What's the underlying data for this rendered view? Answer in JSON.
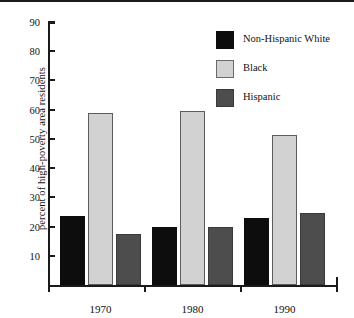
{
  "chart_data": {
    "type": "bar",
    "title": "",
    "xlabel": "",
    "ylabel": "percent of high-poverty area residents",
    "categories": [
      "1970",
      "1980",
      "1990"
    ],
    "series": [
      {
        "name": "Non-Hispanic White",
        "color": "#0d0d0d",
        "values": [
          23.5,
          20.0,
          23.0
        ]
      },
      {
        "name": "Black",
        "color": "#d2d2d2",
        "values": [
          59.0,
          59.5,
          51.5
        ]
      },
      {
        "name": "Hispanic",
        "color": "#4d4d4d",
        "values": [
          17.5,
          20.0,
          24.5
        ]
      }
    ],
    "ylim": [
      0,
      90
    ],
    "ytick_labels": [
      "10",
      "20",
      "30",
      "40",
      "50",
      "60",
      "70",
      "80",
      "90"
    ],
    "ytick_values": [
      10,
      20,
      30,
      40,
      50,
      60,
      70,
      80,
      90
    ],
    "grid": false,
    "legend_position": "top-right"
  },
  "legend": {
    "entries": [
      {
        "label": "Non-Hispanic White"
      },
      {
        "label": "Black"
      },
      {
        "label": "Hispanic"
      }
    ]
  },
  "axes": {
    "y_title": "percent of high-poverty area residents",
    "x_labels": [
      "1970",
      "1980",
      "1990"
    ]
  }
}
